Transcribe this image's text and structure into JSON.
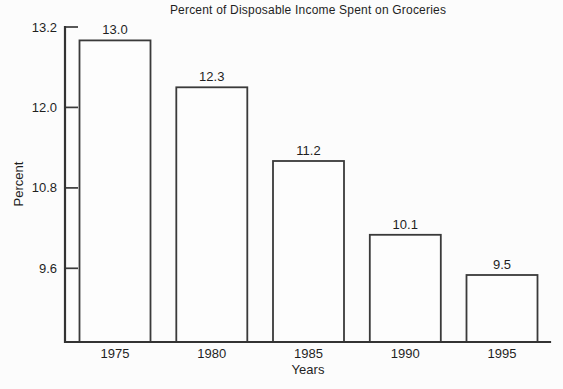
{
  "figure": {
    "background_color": "#fcfcfc",
    "line_color": "#3a3a3a",
    "text_color": "#1f1f1f"
  },
  "chart_data": {
    "type": "bar",
    "title": "Percent of Disposable Income Spent on Groceries",
    "xlabel": "Years",
    "ylabel": "Percent",
    "categories": [
      "1975",
      "1980",
      "1985",
      "1990",
      "1995"
    ],
    "values": [
      13.0,
      12.3,
      11.2,
      10.1,
      9.5
    ],
    "value_labels": [
      "13.0",
      "12.3",
      "11.2",
      "10.1",
      "9.5"
    ],
    "yticks": [
      13.2,
      12.0,
      10.8,
      9.6
    ],
    "ytick_labels": [
      "13.2",
      "12.0",
      "10.8",
      "9.6"
    ],
    "ylim": [
      8.5,
      13.2
    ],
    "grid": false,
    "legend": "none",
    "bar_fill": "white",
    "bar_outline": "black"
  }
}
